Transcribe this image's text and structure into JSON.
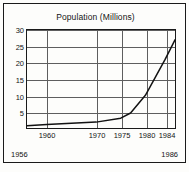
{
  "chart_data": {
    "type": "line",
    "title": "Population (Millions)",
    "xlabel": "",
    "ylabel": "",
    "xlim": [
      1956,
      1986
    ],
    "ylim": [
      0,
      30
    ],
    "grid": true,
    "legend": false,
    "x_axis_start_label": "1956",
    "x_axis_end_label": "1986",
    "xticks": [
      1960,
      1970,
      1975,
      1980,
      1984
    ],
    "xtick_labels": [
      "1960",
      "1970",
      "1975",
      "1980",
      "1984"
    ],
    "yticks": [
      5,
      10,
      15,
      20,
      25,
      30
    ],
    "ytick_labels": [
      "5",
      "10",
      "15",
      "20",
      "25",
      "30"
    ],
    "series": [
      {
        "name": "Population",
        "color": "#121212",
        "x": [
          1956,
          1960,
          1970,
          1975,
          1977,
          1980,
          1982,
          1984,
          1986
        ],
        "values": [
          0.7,
          1.1,
          1.8,
          3.0,
          4.6,
          10.0,
          15.5,
          21.0,
          27.0
        ]
      }
    ]
  }
}
